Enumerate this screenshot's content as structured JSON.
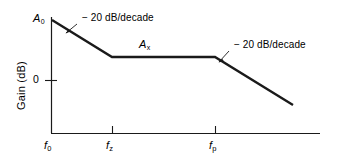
{
  "chart_data": {
    "type": "line",
    "title": "",
    "xlabel": "",
    "ylabel": "Gain (dB)",
    "grid": false,
    "legend_position": "none",
    "x_tick_labels": [
      "f",
      "f",
      "f"
    ],
    "x_tick_subscripts": [
      "0",
      "z",
      "p"
    ],
    "x_ticks_px": [
      51,
      112,
      215
    ],
    "y_tick_labels": [
      "0"
    ],
    "y_ticks_px": [
      80
    ],
    "series": [
      {
        "name": "open-loop gain asymptote",
        "points_px": [
          {
            "x": 52,
            "y": 20
          },
          {
            "x": 112,
            "y": 57
          },
          {
            "x": 215,
            "y": 57
          },
          {
            "x": 293,
            "y": 105
          }
        ],
        "description": "Piecewise asymptotic Bode magnitude: -20 dB/decade roll-off from f0 to fz, flat at Ax between fz and fp, then -20 dB/decade beyond fp"
      }
    ],
    "annotations": [
      {
        "id": "slope-1",
        "text": "− 20 dB/decade",
        "x_px": 80,
        "y_px": 17,
        "leader_from_px": {
          "x": 77,
          "y": 24
        },
        "leader_to_px": {
          "x": 66,
          "y": 33
        }
      },
      {
        "id": "plateau-gain",
        "text": "A",
        "subscript": "x",
        "x_px": 139,
        "y_px": 39
      },
      {
        "id": "slope-2",
        "text": "− 20 dB/decade",
        "x_px": 232,
        "y_px": 44,
        "leader_from_px": {
          "x": 229,
          "y": 51
        },
        "leader_to_px": {
          "x": 219,
          "y": 62
        }
      },
      {
        "id": "initial-gain",
        "text": "A",
        "subscript": "0",
        "x_px": 33,
        "y_px": 13
      }
    ],
    "axes": {
      "x_axis_px": {
        "x1": 51,
        "x2": 320,
        "y": 133
      },
      "y_axis_px": {
        "x": 51,
        "y1": 17,
        "y2": 133
      },
      "axis_color": "#1a1a1a",
      "line_color": "#1a1a1a"
    }
  },
  "labels": {
    "y_axis_title": "Gain (dB)",
    "y_tick_zero": "0",
    "x_tick_f0_base": "f",
    "x_tick_f0_sub": "0",
    "x_tick_fz_base": "f",
    "x_tick_fz_sub": "z",
    "x_tick_fp_base": "f",
    "x_tick_fp_sub": "p",
    "a0_base": "A",
    "a0_sub": "0",
    "ax_base": "A",
    "ax_sub": "x",
    "slope_left": "− 20 dB/decade",
    "slope_right": "− 20 dB/decade"
  },
  "colors": {
    "ink": "#1a1a1a",
    "background": "#ffffff"
  }
}
